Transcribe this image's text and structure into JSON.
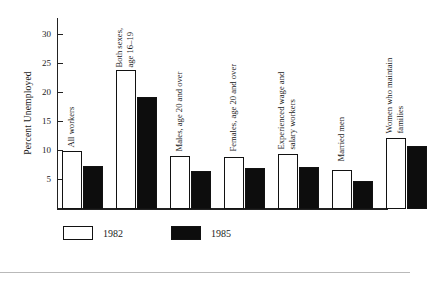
{
  "chart_data": {
    "type": "bar",
    "title": "",
    "xlabel": "",
    "ylabel": "Percent Unemployed",
    "ylim": [
      0,
      32
    ],
    "yticks": [
      5,
      10,
      15,
      20,
      25,
      30
    ],
    "grid": false,
    "legend_position": "bottom-left",
    "categories": [
      "All workers",
      "Both sexes,\nage 16–19",
      "Males, age 20 and over",
      "Females, age 20 and over",
      "Experienced wage and\nsalary workers",
      "Married men",
      "Women who maintain\nfamilies"
    ],
    "series": [
      {
        "name": "1982",
        "color": "#ffffff",
        "values": [
          9.7,
          23.3,
          8.8,
          8.7,
          9.3,
          6.5,
          11.9
        ]
      },
      {
        "name": "1985",
        "color": "#0d0d0d",
        "values": [
          7.2,
          18.7,
          6.4,
          6.9,
          7.0,
          4.7,
          10.6
        ]
      }
    ]
  },
  "axis": {
    "y_title": "Percent Unemployed",
    "tick_labels": [
      "30",
      "25",
      "20",
      "15",
      "10",
      "5"
    ]
  },
  "categories": [
    {
      "line1": "All workers",
      "line2": ""
    },
    {
      "line1": "Both sexes,",
      "line2": "age 16–19"
    },
    {
      "line1": "Males, age 20 and over",
      "line2": ""
    },
    {
      "line1": "Females, age 20 and over",
      "line2": ""
    },
    {
      "line1": "Experienced wage and",
      "line2": "salary workers"
    },
    {
      "line1": "Married men",
      "line2": ""
    },
    {
      "line1": "Women who maintain",
      "line2": "families"
    }
  ],
  "legend": {
    "items": [
      {
        "label": "1982",
        "swatch": "white-swatch"
      },
      {
        "label": "1985",
        "swatch": "black-swatch"
      }
    ]
  }
}
